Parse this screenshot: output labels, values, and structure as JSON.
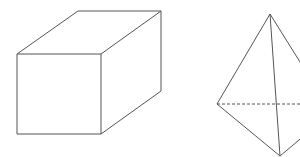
{
  "diagram": {
    "shapes": [
      {
        "name": "cube",
        "kind": "cuboid (oblique projection)"
      },
      {
        "name": "tetrahedron",
        "kind": "triangular pyramid with hidden edge dashed"
      }
    ],
    "colors": {
      "stroke": "#555555",
      "background": "#ffffff"
    }
  }
}
